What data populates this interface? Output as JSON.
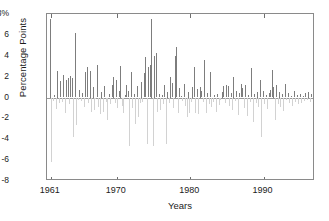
{
  "chart_data": {
    "type": "bar",
    "title": "",
    "subtitle": "",
    "xlabel": "Years",
    "ylabel": "Percentage Points",
    "ylim": [
      -8,
      8
    ],
    "xlim": [
      1960.5,
      1997.0
    ],
    "grid": false,
    "legend": null,
    "ytick_labels": [
      "8%",
      "6",
      "4",
      "2",
      "0",
      "-2",
      "-4",
      "-6",
      "-8"
    ],
    "ytick_values": [
      8,
      6,
      4,
      2,
      0,
      -2,
      -4,
      -6,
      -8
    ],
    "xtick_labels": [
      "1961",
      "1970",
      "1980",
      "1990"
    ],
    "xtick_values": [
      1961,
      1970,
      1980,
      1990
    ],
    "colors": {
      "positive": "#7d7d7d",
      "negative": "#d2d2d2",
      "axis": "#8a8a8a",
      "zero": "#9a9a9a"
    },
    "x": [
      1960.9,
      1961.1,
      1961.3,
      1961.5,
      1961.7,
      1961.9,
      1962.1,
      1962.3,
      1962.5,
      1962.7,
      1962.9,
      1963.1,
      1963.3,
      1963.5,
      1963.7,
      1963.9,
      1964.1,
      1964.3,
      1964.5,
      1964.7,
      1964.9,
      1965.1,
      1965.3,
      1965.5,
      1965.7,
      1965.9,
      1966.1,
      1966.3,
      1966.5,
      1966.7,
      1966.9,
      1967.1,
      1967.3,
      1967.5,
      1967.7,
      1967.9,
      1968.1,
      1968.3,
      1968.5,
      1968.7,
      1968.9,
      1969.1,
      1969.3,
      1969.5,
      1969.7,
      1969.9,
      1970.1,
      1970.3,
      1970.5,
      1970.7,
      1970.9,
      1971.1,
      1971.3,
      1971.5,
      1971.7,
      1971.9,
      1972.1,
      1972.3,
      1972.5,
      1972.7,
      1972.9,
      1973.1,
      1973.3,
      1973.5,
      1973.7,
      1973.9,
      1974.1,
      1974.3,
      1974.5,
      1974.7,
      1974.9,
      1975.1,
      1975.3,
      1975.5,
      1975.7,
      1975.9,
      1976.1,
      1976.3,
      1976.5,
      1976.7,
      1976.9,
      1977.1,
      1977.3,
      1977.5,
      1977.7,
      1977.9,
      1978.1,
      1978.3,
      1978.5,
      1978.7,
      1978.9,
      1979.1,
      1979.3,
      1979.5,
      1979.7,
      1979.9,
      1980.1,
      1980.3,
      1980.5,
      1980.7,
      1980.9,
      1981.1,
      1981.3,
      1981.5,
      1981.7,
      1981.9,
      1982.1,
      1982.3,
      1982.5,
      1982.7,
      1982.9,
      1983.1,
      1983.3,
      1983.5,
      1983.7,
      1983.9,
      1984.1,
      1984.3,
      1984.5,
      1984.7,
      1984.9,
      1985.1,
      1985.3,
      1985.5,
      1985.7,
      1985.9,
      1986.1,
      1986.3,
      1986.5,
      1986.7,
      1986.9,
      1987.1,
      1987.3,
      1987.5,
      1987.7,
      1987.9,
      1988.1,
      1988.3,
      1988.5,
      1988.7,
      1988.9,
      1989.1,
      1989.3,
      1989.5,
      1989.7,
      1989.9,
      1990.1,
      1990.3,
      1990.5,
      1990.7,
      1990.9,
      1991.1,
      1991.3,
      1991.5,
      1991.7,
      1991.9,
      1992.1,
      1992.3,
      1992.5,
      1992.7,
      1992.9,
      1993.1,
      1993.3,
      1993.5,
      1993.7,
      1993.9,
      1994.1,
      1994.3,
      1994.5,
      1994.7,
      1994.9,
      1995.1,
      1995.3,
      1995.5,
      1995.7,
      1995.9,
      1996.1,
      1996.3,
      1996.5
    ],
    "values": [
      7.5,
      -6.2,
      -0.3,
      0.2,
      -1.1,
      2.5,
      -0.5,
      1.6,
      -0.4,
      2.2,
      -1.5,
      1.7,
      1.9,
      -0.6,
      2.1,
      1.9,
      -3.8,
      6.2,
      -2.6,
      -0.2,
      0.7,
      -0.3,
      0.4,
      -0.9,
      2.4,
      2.9,
      -0.5,
      2.5,
      -1.4,
      1.0,
      -1.2,
      -0.1,
      3.1,
      -0.9,
      -1.6,
      0.5,
      -1.4,
      1.1,
      -0.4,
      -2.2,
      0.3,
      -0.6,
      1.2,
      2.0,
      -0.5,
      1.7,
      -1.0,
      0.6,
      3.0,
      -0.8,
      -1.5,
      0.2,
      1.2,
      0.6,
      -4.6,
      2.4,
      -1.0,
      0.3,
      -2.5,
      1.1,
      -1.9,
      -0.5,
      1.5,
      -0.4,
      2.3,
      3.9,
      -4.5,
      2.9,
      3.1,
      7.5,
      -4.6,
      4.0,
      4.3,
      -1.4,
      0.3,
      -1.2,
      0.2,
      -0.6,
      1.2,
      -4.5,
      0.5,
      -0.5,
      2.0,
      1.4,
      -1.0,
      4.0,
      4.8,
      -1.5,
      0.9,
      0.1,
      -0.3,
      1.3,
      -0.8,
      -1.9,
      0.5,
      -1.5,
      -0.4,
      1.0,
      2.9,
      -1.5,
      0.8,
      -1.6,
      1.0,
      0.6,
      -0.4,
      3.6,
      -1.5,
      0.4,
      -0.6,
      2.4,
      -0.9,
      -0.4,
      0.2,
      -1.4,
      0.3,
      -0.7,
      -0.2,
      0.5,
      1.1,
      -0.5,
      1.2,
      1.1,
      -0.8,
      0.4,
      -1.2,
      2.0,
      -0.3,
      0.6,
      -1.7,
      0.4,
      1.3,
      0.9,
      -1.0,
      1.2,
      -1.8,
      0.2,
      -0.4,
      2.8,
      -2.3,
      0.3,
      -0.5,
      0.5,
      -0.9,
      1.7,
      -3.8,
      0.6,
      -0.6,
      0.2,
      -1.1,
      0.4,
      0.7,
      2.6,
      1.0,
      -2.2,
      1.2,
      -0.6,
      0.5,
      -0.9,
      0.3,
      -1.3,
      1.3,
      -0.2,
      0.4,
      -0.5,
      0.1,
      -0.8,
      0.6,
      -0.4,
      0.2,
      -0.6,
      0.3,
      -0.5,
      0.1,
      -0.3,
      0.4,
      -0.2,
      0.5,
      -0.4,
      0.3
    ]
  }
}
